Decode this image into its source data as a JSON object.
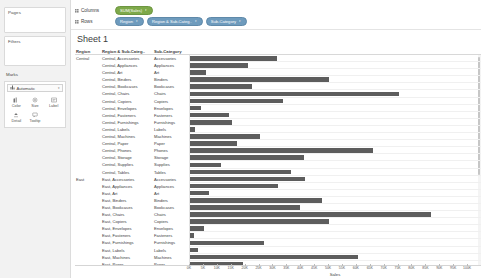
{
  "left_panel": {
    "pages_label": "Pages",
    "filters_label": "Filters",
    "marks_label": "Marks",
    "marks_type": "Automatic",
    "marks_type_icon": "bar-mark-icon",
    "marks_caret": "▾",
    "mark_buttons": [
      {
        "label": "Color",
        "icon": "color-icon"
      },
      {
        "label": "Size",
        "icon": "size-icon"
      },
      {
        "label": "Label",
        "icon": "label-icon"
      },
      {
        "label": "Detail",
        "icon": "detail-icon"
      },
      {
        "label": "Tooltip",
        "icon": "tooltip-icon"
      }
    ]
  },
  "shelves": {
    "columns_label": "Columns",
    "rows_label": "Rows",
    "columns_pills": [
      {
        "text": "SUM(Sales)",
        "color": "green",
        "caret": "▾"
      }
    ],
    "rows_pills": [
      {
        "text": "Region",
        "color": "blue",
        "caret": "▾"
      },
      {
        "text": "Region & Sub-Categ..",
        "color": "blue",
        "caret": "▾"
      },
      {
        "text": "Sub-Category",
        "color": "blue",
        "caret": "▾"
      }
    ],
    "colors": {
      "measure_green": "#7ea94a",
      "dimension_blue": "#6e9bbd"
    }
  },
  "sheet": {
    "title": "Sheet 1"
  },
  "table": {
    "headers": {
      "region": "Region",
      "combined": "Region & Sub-Categ..",
      "sub_category": "Sub-Category"
    }
  },
  "chart_data": {
    "type": "bar",
    "title": "Sheet 1",
    "xlabel": "Sales",
    "ylabel": "",
    "orientation": "horizontal",
    "xlim": [
      0,
      105000
    ],
    "grid": true,
    "legend": null,
    "bar_color": "#5d5d5d",
    "tick_labels": [
      "0K",
      "5K",
      "10K",
      "15K",
      "20K",
      "25K",
      "30K",
      "35K",
      "40K",
      "45K",
      "50K",
      "55K",
      "60K",
      "65K",
      "70K",
      "75K",
      "80K",
      "85K",
      "90K",
      "95K",
      "100K"
    ],
    "tick_values": [
      0,
      5000,
      10000,
      15000,
      20000,
      25000,
      30000,
      35000,
      40000,
      45000,
      50000,
      55000,
      60000,
      65000,
      70000,
      75000,
      80000,
      85000,
      90000,
      95000,
      100000
    ],
    "categories": [
      "Central - Accessories",
      "Central - Appliances",
      "Central - Art",
      "Central - Binders",
      "Central - Bookcases",
      "Central - Chairs",
      "Central - Copiers",
      "Central - Envelopes",
      "Central - Fasteners",
      "Central - Furnishings",
      "Central - Labels",
      "Central - Machines",
      "Central - Paper",
      "Central - Phones",
      "Central - Storage",
      "Central - Supplies",
      "Central - Tables",
      "East - Accessories",
      "East - Appliances",
      "East - Art",
      "East - Binders",
      "East - Bookcases",
      "East - Chairs",
      "East - Copiers",
      "East - Envelopes",
      "East - Fasteners",
      "East - Furnishings",
      "East - Labels",
      "East - Machines",
      "East - Paper",
      "East - Phones",
      "East - Storage"
    ],
    "values": [
      31500,
      21000,
      5800,
      50200,
      22400,
      75500,
      33500,
      3900,
      14200,
      15200,
      1900,
      25400,
      17100,
      66000,
      41000,
      11300,
      36500,
      41500,
      31800,
      6700,
      47500,
      39700,
      87000,
      50000,
      5100,
      1500,
      26600,
      3000,
      60500,
      19200,
      97000,
      42000
    ],
    "rows": [
      {
        "region": "Central",
        "combined": "Central, Accessories",
        "sub_category": "Accessories",
        "value": 31500
      },
      {
        "region": "",
        "combined": "Central, Appliances",
        "sub_category": "Appliances",
        "value": 21000
      },
      {
        "region": "",
        "combined": "Central, Art",
        "sub_category": "Art",
        "value": 5800
      },
      {
        "region": "",
        "combined": "Central, Binders",
        "sub_category": "Binders",
        "value": 50200
      },
      {
        "region": "",
        "combined": "Central, Bookcases",
        "sub_category": "Bookcases",
        "value": 22400
      },
      {
        "region": "",
        "combined": "Central, Chairs",
        "sub_category": "Chairs",
        "value": 75500
      },
      {
        "region": "",
        "combined": "Central, Copiers",
        "sub_category": "Copiers",
        "value": 33500
      },
      {
        "region": "",
        "combined": "Central, Envelopes",
        "sub_category": "Envelopes",
        "value": 3900
      },
      {
        "region": "",
        "combined": "Central, Fasteners",
        "sub_category": "Fasteners",
        "value": 14200
      },
      {
        "region": "",
        "combined": "Central, Furnishings",
        "sub_category": "Furnishings",
        "value": 15200
      },
      {
        "region": "",
        "combined": "Central, Labels",
        "sub_category": "Labels",
        "value": 1900
      },
      {
        "region": "",
        "combined": "Central, Machines",
        "sub_category": "Machines",
        "value": 25400
      },
      {
        "region": "",
        "combined": "Central, Paper",
        "sub_category": "Paper",
        "value": 17100
      },
      {
        "region": "",
        "combined": "Central, Phones",
        "sub_category": "Phones",
        "value": 66000
      },
      {
        "region": "",
        "combined": "Central, Storage",
        "sub_category": "Storage",
        "value": 41000
      },
      {
        "region": "",
        "combined": "Central, Supplies",
        "sub_category": "Supplies",
        "value": 11300
      },
      {
        "region": "",
        "combined": "Central, Tables",
        "sub_category": "Tables",
        "value": 36500
      },
      {
        "region": "East",
        "combined": "East, Accessories",
        "sub_category": "Accessories",
        "value": 41500
      },
      {
        "region": "",
        "combined": "East, Appliances",
        "sub_category": "Appliances",
        "value": 31800
      },
      {
        "region": "",
        "combined": "East, Art",
        "sub_category": "Art",
        "value": 6700
      },
      {
        "region": "",
        "combined": "East, Binders",
        "sub_category": "Binders",
        "value": 47500
      },
      {
        "region": "",
        "combined": "East, Bookcases",
        "sub_category": "Bookcases",
        "value": 39700
      },
      {
        "region": "",
        "combined": "East, Chairs",
        "sub_category": "Chairs",
        "value": 87000
      },
      {
        "region": "",
        "combined": "East, Copiers",
        "sub_category": "Copiers",
        "value": 50000
      },
      {
        "region": "",
        "combined": "East, Envelopes",
        "sub_category": "Envelopes",
        "value": 5100
      },
      {
        "region": "",
        "combined": "East, Fasteners",
        "sub_category": "Fasteners",
        "value": 1500
      },
      {
        "region": "",
        "combined": "East, Furnishings",
        "sub_category": "Furnishings",
        "value": 26600
      },
      {
        "region": "",
        "combined": "East, Labels",
        "sub_category": "Labels",
        "value": 3000
      },
      {
        "region": "",
        "combined": "East, Machines",
        "sub_category": "Machines",
        "value": 60500
      },
      {
        "region": "",
        "combined": "East, Paper",
        "sub_category": "Paper",
        "value": 19200
      },
      {
        "region": "",
        "combined": "East, Phones",
        "sub_category": "Phones",
        "value": 97000
      },
      {
        "region": "",
        "combined": "East, Storage",
        "sub_category": "Storage",
        "value": 42000
      }
    ]
  }
}
